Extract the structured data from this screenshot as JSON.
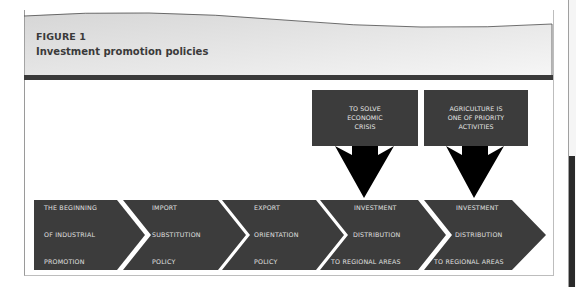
{
  "figure": {
    "label": "FIGURE 1",
    "title": "Investment promotion policies"
  },
  "colors": {
    "box_fill": "#3c3c3c",
    "arrow_fill": "#000000",
    "header_gradient_start": "#d9d9d9",
    "header_gradient_end": "#f4f4f4",
    "header_rule": "#3a3a3a"
  },
  "callouts": [
    {
      "lines": [
        "TO SOLVE",
        "ECONOMIC",
        "CRISIS"
      ]
    },
    {
      "lines": [
        "AGRICULTURE IS",
        "ONE OF PRIORITY",
        "ACTIVITIES"
      ]
    }
  ],
  "stages": [
    {
      "lines": [
        "THE BEGINNING",
        "OF INDUSTRIAL",
        "PROMOTION"
      ]
    },
    {
      "lines": [
        "IMPORT",
        "SUBSTITUTION",
        "POLICY"
      ]
    },
    {
      "lines": [
        "EXPORT",
        "ORIENTATION",
        "POLICY"
      ]
    },
    {
      "lines": [
        "INVESTMENT",
        "DISTRIBUTION",
        "TO REGIONAL AREAS"
      ]
    },
    {
      "lines": [
        "INVESTMENT",
        "DISTRIBUTION",
        "TO REGIONAL AREAS"
      ]
    }
  ]
}
